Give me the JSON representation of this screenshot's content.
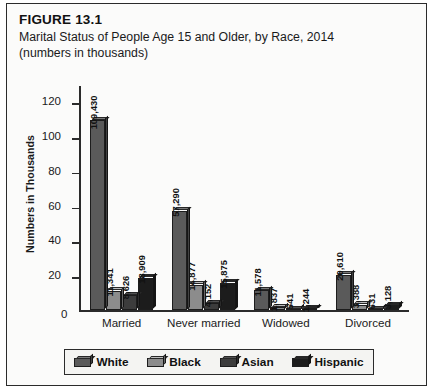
{
  "figure": {
    "number": "FIGURE 13.1",
    "title": "Marital Status of People Age 15 and Older, by Race, 2014 (numbers in thousands)"
  },
  "chart_data": {
    "type": "bar",
    "title": "Marital Status of People Age 15 and Older, by Race, 2014 (numbers in thousands)",
    "xlabel": "",
    "ylabel": "Numbers in Thousands",
    "ylim": [
      0,
      130
    ],
    "yticks": [
      0,
      20,
      40,
      60,
      80,
      100,
      120
    ],
    "grid": false,
    "legend_position": "bottom",
    "categories": [
      "Married",
      "Never married",
      "Widowed",
      "Divorced"
    ],
    "series": [
      {
        "name": "White",
        "color": "#5a5a5a",
        "values": [
          109430,
          57290,
          11578,
          20610
        ],
        "labels": [
          "109,430",
          "57,290",
          "11,578",
          "20,610"
        ]
      },
      {
        "name": "Black",
        "color": "#8c8c8c",
        "values": [
          11341,
          14877,
          1837,
          3388
        ],
        "labels": [
          "11,341",
          "14,877",
          "1,837",
          "3,388"
        ]
      },
      {
        "name": "Asian",
        "color": "#3c3c3c",
        "values": [
          8626,
          4152,
          541,
          631
        ],
        "labels": [
          "8,626",
          "4,152",
          "541",
          "631"
        ]
      },
      {
        "name": "Hispanic",
        "color": "#1c1c1c",
        "values": [
          18909,
          15875,
          1244,
          3128
        ],
        "labels": [
          "18,909",
          "15,875",
          "1,244",
          "3,128"
        ]
      }
    ]
  },
  "axis": {
    "zero_label": "0",
    "tick_labels": [
      "120",
      "100",
      "80",
      "60",
      "40",
      "20"
    ],
    "y_axis_title": "Numbers in Thousands"
  },
  "legend": {
    "items": [
      {
        "label": "White",
        "color": "#5a5a5a"
      },
      {
        "label": "Black",
        "color": "#8c8c8c"
      },
      {
        "label": "Asian",
        "color": "#3c3c3c"
      },
      {
        "label": "Hispanic",
        "color": "#1c1c1c"
      }
    ]
  }
}
